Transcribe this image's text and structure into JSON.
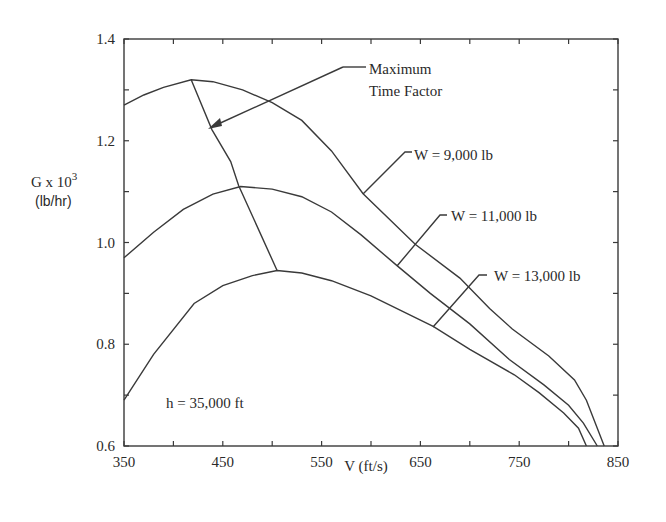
{
  "chart_data": {
    "type": "line",
    "title": "",
    "xlabel": "V (ft/s)",
    "ylabel": "G x 10^3",
    "ylabel_main": "G x 10",
    "ylabel_exp": "3",
    "ylabel_unit": "(lb/hr)",
    "xlim": [
      350,
      850
    ],
    "ylim": [
      0.6,
      1.4
    ],
    "x_ticks": [
      350,
      450,
      550,
      650,
      750,
      850
    ],
    "x_tick_labels": [
      "350",
      "450",
      "550",
      "650",
      "750",
      "850"
    ],
    "x_minor_step": 50,
    "y_ticks": [
      0.6,
      0.8,
      1.0,
      1.2,
      1.4
    ],
    "y_tick_labels": [
      "0.6",
      "0.8",
      "1.0",
      "1.2",
      "1.4"
    ],
    "y_minor_step": 0.1,
    "grid": false,
    "legend": "none (inline annotations)",
    "series": [
      {
        "name": "W = 9,000 lb",
        "x": [
          350,
          370,
          390,
          418,
          440,
          470,
          500,
          530,
          560,
          592,
          645,
          690,
          720,
          743,
          780,
          806,
          818,
          836
        ],
        "y": [
          1.27,
          1.29,
          1.305,
          1.32,
          1.316,
          1.3,
          1.275,
          1.24,
          1.18,
          1.096,
          0.996,
          0.93,
          0.87,
          0.83,
          0.777,
          0.73,
          0.69,
          0.6
        ]
      },
      {
        "name": "W = 11,000 lb",
        "x": [
          350,
          380,
          410,
          440,
          468,
          500,
          530,
          560,
          590,
          626,
          660,
          700,
          740,
          775,
          800,
          815,
          829
        ],
        "y": [
          0.97,
          1.02,
          1.065,
          1.095,
          1.11,
          1.105,
          1.09,
          1.06,
          1.015,
          0.955,
          0.9,
          0.84,
          0.77,
          0.72,
          0.68,
          0.645,
          0.6
        ]
      },
      {
        "name": "W = 13,000 lb",
        "x": [
          350,
          380,
          421,
          450,
          480,
          505,
          530,
          560,
          600,
          663,
          700,
          745,
          770,
          795,
          810,
          818
        ],
        "y": [
          0.69,
          0.78,
          0.88,
          0.915,
          0.935,
          0.945,
          0.94,
          0.925,
          0.895,
          0.835,
          0.79,
          0.74,
          0.705,
          0.665,
          0.635,
          0.6
        ]
      },
      {
        "name": "Maximum Time Factor",
        "x": [
          418,
          439,
          458,
          466,
          505
        ],
        "y": [
          1.32,
          1.222,
          1.159,
          1.112,
          0.945
        ]
      }
    ],
    "annotations": [
      {
        "text": "Maximum Time Factor",
        "line1": "Maximum",
        "line2": "Time Factor",
        "points_to": [
          439,
          1.222
        ]
      },
      {
        "text": "W = 9,000 lb",
        "points_to": [
          592,
          1.096
        ]
      },
      {
        "text": "W = 11,000 lb",
        "points_to": [
          626,
          0.955
        ]
      },
      {
        "text": "W = 13,000 lb",
        "points_to": [
          663,
          0.835
        ]
      },
      {
        "text": "h = 35,000 ft"
      }
    ]
  },
  "labels": {
    "max_time_factor_line1": "Maximum",
    "max_time_factor_line2": "Time Factor",
    "w9000": "W = 9,000 lb",
    "w11000": "W = 11,000 lb",
    "w13000": "W = 13,000 lb",
    "altitude": "h = 35,000 ft",
    "xlabel": "V (ft/s)",
    "ylabel_main": "G x 10",
    "ylabel_exp": "3",
    "ylabel_unit": "(lb/hr)"
  },
  "colors": {
    "line": "#3a3a3a",
    "text": "#2a2a2a",
    "background": "#ffffff"
  }
}
